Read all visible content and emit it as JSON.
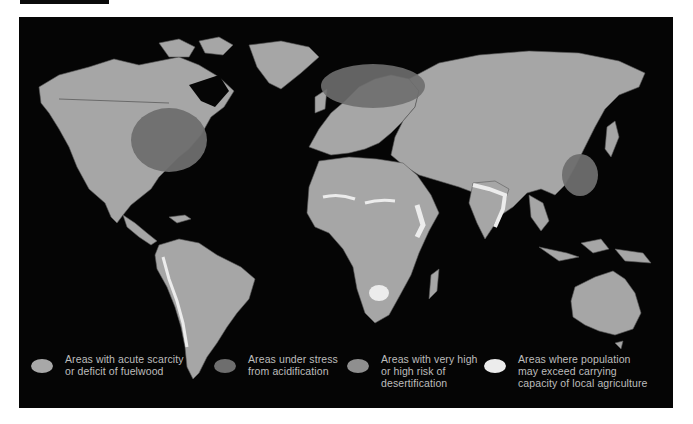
{
  "colors": {
    "background": "#ffffff",
    "panel": "#050505",
    "land": "#a6a6a6",
    "borders": "#5a5a5a",
    "fuelwood": "#a8a8a8",
    "acidification": "#6e6e6e",
    "desertification": "#8f8f8f",
    "overpopulation": "#ececec",
    "legend_text": "#bdbdbd"
  },
  "legend": {
    "items": [
      {
        "id": "fuelwood",
        "lines": [
          "Areas with acute scarcity",
          "or deficit of fuelwood"
        ],
        "color": "#a8a8a8"
      },
      {
        "id": "acidification",
        "lines": [
          "Areas under stress",
          "from acidification"
        ],
        "color": "#6e6e6e"
      },
      {
        "id": "desertification",
        "lines": [
          "Areas with very high",
          "or high risk of",
          "desertification"
        ],
        "color": "#8f8f8f"
      },
      {
        "id": "overpopulation",
        "lines": [
          "Areas where population",
          "may exceed carrying",
          "capacity of local agriculture"
        ],
        "color": "#ececec"
      }
    ]
  },
  "map": {
    "acidification_zones": [
      "Eastern North America",
      "Northern and Central Europe",
      "Eastern China"
    ],
    "overpopulation_zones": [
      "Sahel",
      "Horn of Africa",
      "Southern Africa",
      "India",
      "Andes / western South America",
      "Mexico"
    ]
  }
}
